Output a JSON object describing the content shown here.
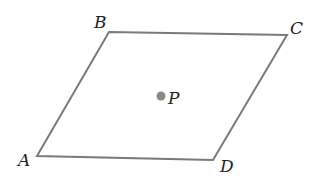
{
  "diagram": {
    "shape": "parallelogram",
    "vertices": [
      {
        "name": "A",
        "x": 37,
        "y": 156
      },
      {
        "name": "B",
        "x": 109,
        "y": 32
      },
      {
        "name": "C",
        "x": 287,
        "y": 35
      },
      {
        "name": "D",
        "x": 213,
        "y": 160
      }
    ],
    "point": {
      "name": "P",
      "x": 161,
      "y": 96
    },
    "labels": {
      "A": "A",
      "B": "B",
      "C": "C",
      "D": "D",
      "P": "P"
    },
    "colors": {
      "edge": "#7a7a7a",
      "point": "#8a8a8a",
      "text": "#222222"
    }
  }
}
